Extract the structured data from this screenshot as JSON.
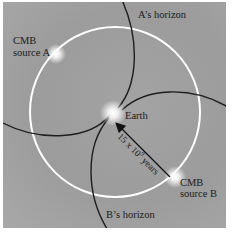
{
  "diagram": {
    "type": "cosmic-horizon-illustration",
    "labels": {
      "source_a_line1": "CMB",
      "source_a_line2": "source A",
      "source_b_line1": "CMB",
      "source_b_line2": "source B",
      "earth": "Earth",
      "a_horizon": "A’s horizon",
      "b_horizon": "B’s horizon",
      "arrow_base": "15 x 10",
      "arrow_exp": "9",
      "arrow_unit": " years"
    },
    "colors": {
      "background": "#9e9e9e",
      "circle": "#ffffff",
      "curves": "#1e1e1e",
      "glow": "#ffffff"
    }
  }
}
